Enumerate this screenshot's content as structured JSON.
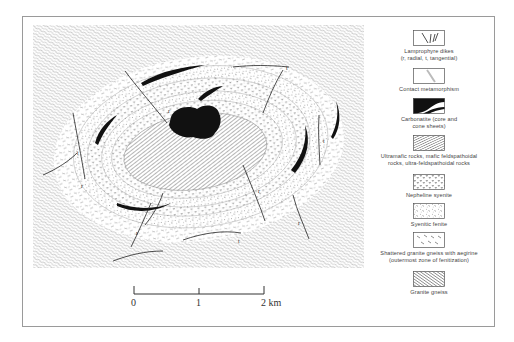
{
  "figure": {
    "title": "",
    "map": {
      "description": "Concentric alkaline ring complex with carbonatite core",
      "units_center_to_edge": [
        "Carbonatite core",
        "Ultramafic rocks",
        "Nepheline syenite",
        "Syenitic fenite",
        "Nepheline syenite",
        "Syenitic fenite",
        "Shattered granite gneiss with aegirine",
        "Granite gneiss"
      ],
      "dike_labels": [
        "t",
        "r",
        "t",
        "r",
        "r",
        "t",
        "r",
        "t",
        "r"
      ]
    },
    "legend": {
      "items": [
        {
          "id": "lamprophyre-dikes",
          "label_lines": [
            "Lamprophyre dikes",
            "(r, radial, t, tangential)"
          ],
          "pattern": "dikes"
        },
        {
          "id": "contact-metamorphism",
          "label_lines": [
            "Contact metamorphism"
          ],
          "pattern": "contact"
        },
        {
          "id": "carbonatite",
          "label_lines": [
            "Carbonatite (core and",
            "cone sheets)"
          ],
          "pattern": "solid-black"
        },
        {
          "id": "ultramafic",
          "label_lines": [
            "Ultramafic rocks, mafic feldspathoidal",
            "rocks, ultra-feldspathoidal rocks"
          ],
          "pattern": "fine-hatch"
        },
        {
          "id": "nepheline-syenite",
          "label_lines": [
            "Nepheline syenite"
          ],
          "pattern": "v-marks"
        },
        {
          "id": "syenitic-fenite",
          "label_lines": [
            "Syenitic fenite"
          ],
          "pattern": "dots-dashes"
        },
        {
          "id": "shattered-gneiss",
          "label_lines": [
            "Shattered granite gneiss with aegirine",
            "(outermost zone of fenitization)"
          ],
          "pattern": "sparse-dashes"
        },
        {
          "id": "granite-gneiss",
          "label_lines": [
            "Granite gneiss"
          ],
          "pattern": "dense-hatch"
        }
      ]
    },
    "scale_bar": {
      "ticks": [
        "0",
        "1",
        "2 km"
      ],
      "unit": "km",
      "max_value": 2
    },
    "colors": {
      "ink": "#111111",
      "hatch": "#777777",
      "frame": "#9a9a9a",
      "text": "#444444"
    }
  }
}
